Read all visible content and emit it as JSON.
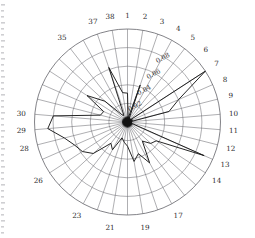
{
  "chart_data": {
    "type": "line",
    "title": "",
    "subtitle": "",
    "xlabel": "",
    "ylabel": "",
    "polar": true,
    "grid": true,
    "legend_position": "none",
    "n_spokes": 38,
    "angle_start_deg": 90,
    "angle_direction": "clockwise",
    "rlim": [
      0,
      0.1
    ],
    "radial_ticks": [
      0.02,
      0.04,
      0.06,
      0.08
    ],
    "radial_tick_labels": [
      "0.02",
      "0.04",
      "0.06",
      "0.08"
    ],
    "radial_tick_angle_deg": 60,
    "rings": 5,
    "categories": [
      "1",
      "2",
      "3",
      "4",
      "5",
      "6",
      "7",
      "8",
      "9",
      "10",
      "11",
      "12",
      "13",
      "14",
      "15",
      "16",
      "17",
      "18",
      "19",
      "20",
      "21",
      "22",
      "23",
      "24",
      "25",
      "26",
      "27",
      "28",
      "29",
      "30",
      "31",
      "32",
      "33",
      "34",
      "35",
      "36",
      "37",
      "38"
    ],
    "visible_tick_labels": [
      "1",
      "2",
      "3",
      "4",
      "5",
      "6",
      "7",
      "8",
      "9",
      "10",
      "11",
      "12",
      "13",
      "14",
      "17",
      "19",
      "21",
      "23",
      "26",
      "28",
      "29",
      "30",
      "35",
      "37",
      "38"
    ],
    "values": [
      0.031,
      0.004,
      0.042,
      0.003,
      0.002,
      0.002,
      0.1,
      0.06,
      0.046,
      0.003,
      0.002,
      0.003,
      0.09,
      0.037,
      0.034,
      0.026,
      0.05,
      0.036,
      0.043,
      0.026,
      0.022,
      0.018,
      0.034,
      0.029,
      0.05,
      0.058,
      0.062,
      0.07,
      0.086,
      0.08,
      0.03,
      0.028,
      0.052,
      0.033,
      0.01,
      0.008,
      0.062,
      0.032
    ],
    "annotations": [],
    "colors": {
      "series": "#1a1a1a",
      "grid": "#6d6d72",
      "label": "#2b2b2b"
    }
  }
}
